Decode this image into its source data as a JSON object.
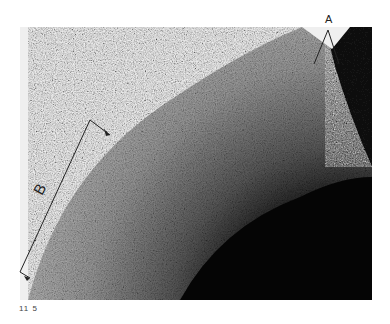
{
  "figure": {
    "caption_number": "11 5",
    "annotations": {
      "a_label": "A",
      "b_label": "B"
    },
    "colors": {
      "background": "#ffffff",
      "photo_bg": "#efefef",
      "surface_mid": "#7a7a7a",
      "surface_dark": "#0a0a0a",
      "annotation_line": "#222222"
    }
  }
}
